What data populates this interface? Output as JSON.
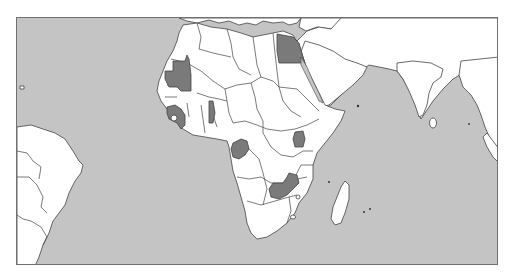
{
  "map": {
    "title": "Africa highlighted countries map",
    "colors": {
      "ocean": "#c4c4c4",
      "land": "#ffffff",
      "highlight": "#7a7a7a",
      "border": "#444444",
      "frame": "#707070"
    },
    "highlighted_countries": [
      "Mauritania",
      "Guinea",
      "Togo",
      "Egypt",
      "Gabon",
      "Uganda",
      "Zambia"
    ],
    "visible_regions": [
      "Africa",
      "Middle East",
      "South Asia",
      "South America (east)",
      "Southern Europe (coast)",
      "Madagascar"
    ]
  }
}
